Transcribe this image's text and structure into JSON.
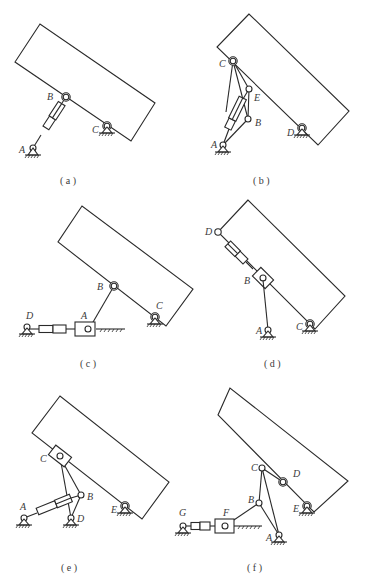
{
  "figure": {
    "panels": [
      {
        "id": "a",
        "caption": "( a )",
        "labels": {
          "A": "A",
          "B": "B",
          "C": "C"
        },
        "description": "Rectangular body pivoted at ground joint C, driven by hydraulic cylinder A–B"
      },
      {
        "id": "b",
        "caption": "( b )",
        "labels": {
          "A": "A",
          "B": "B",
          "C": "C",
          "D": "D",
          "E": "E"
        },
        "description": "Rectangular body pivoted at D, cylinder from A drives linkage C–E–B"
      },
      {
        "id": "c",
        "caption": "( c )",
        "labels": {
          "A": "A",
          "B": "B",
          "C": "C",
          "D": "D"
        },
        "description": "Rectangular body pivoted at C, link A–B, slider A on guide driven by horizontal cylinder from D"
      },
      {
        "id": "d",
        "caption": "( d )",
        "labels": {
          "A": "A",
          "B": "B",
          "C": "C",
          "D": "D"
        },
        "description": "Rectangular body pivoted at C, cylinder D–B along body edge, link A–B with slider"
      },
      {
        "id": "e",
        "caption": "( e )",
        "labels": {
          "A": "A",
          "B": "B",
          "C": "C",
          "D": "D",
          "E": "E"
        },
        "description": "Rectangular body pivoted at E, slider C on body edge, triangle C–B–D pivoted at D, cylinder from A to B"
      },
      {
        "id": "f",
        "caption": "( f )",
        "labels": {
          "A": "A",
          "B": "B",
          "C": "C",
          "D": "D",
          "E": "E",
          "F": "F",
          "G": "G"
        },
        "description": "Rectangular body pivoted at E, link C–D, link A–C with joint B, link B–F, slider F driven by cylinder from G"
      }
    ]
  }
}
